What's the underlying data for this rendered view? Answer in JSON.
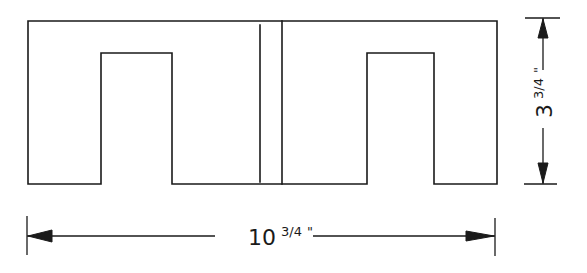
{
  "drawing": {
    "type": "technical-drawing",
    "subject": "E-I laminated core outline (two E-shapes back to back)",
    "outline": {
      "left": 28,
      "top": 21,
      "right": 497,
      "bottom": 184
    },
    "notches": [
      {
        "name": "left-window",
        "left": 101,
        "right": 172,
        "top": 53,
        "bottom": 184
      },
      {
        "name": "right-window",
        "left": 367,
        "right": 434,
        "top": 53,
        "bottom": 184
      }
    ],
    "center_lines": [
      {
        "x": 260,
        "top": 25,
        "bottom": 182
      },
      {
        "x": 282,
        "top": 21,
        "bottom": 184
      }
    ],
    "line_color": "#1a1a1a",
    "background_color": "#ffffff"
  },
  "dimensions": {
    "width": {
      "whole": "10",
      "fraction": "3/4",
      "unit": "\"",
      "label": "10 3/4\"",
      "y": 236,
      "x_start": 27,
      "x_end": 495
    },
    "height": {
      "whole": "3",
      "fraction": "3/4",
      "unit": "\"",
      "label": "3 3/4\"",
      "x": 543,
      "y_start": 18,
      "y_end": 184
    }
  }
}
